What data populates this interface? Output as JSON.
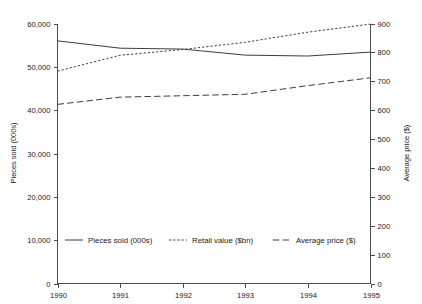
{
  "chart_data": {
    "type": "line",
    "title": "",
    "subtitle": "",
    "xlabel": "",
    "ylabel": "Pieces sold (000s)",
    "y2label": "Average price ($)",
    "x": [
      "1990",
      "1991",
      "1992",
      "1993",
      "1994",
      "1995"
    ],
    "categories": [
      "1990",
      "1991",
      "1992",
      "1993",
      "1994",
      "1995"
    ],
    "ylim": [
      0,
      60000
    ],
    "y2lim": [
      0,
      900
    ],
    "yticks": [
      "0",
      "10,000",
      "20,000",
      "30,000",
      "40,000",
      "50,000",
      "60,000"
    ],
    "ytick_values": [
      0,
      10000,
      20000,
      30000,
      40000,
      50000,
      60000
    ],
    "y2ticks": [
      "0",
      "100",
      "200",
      "300",
      "400",
      "500",
      "600",
      "700",
      "800",
      "900"
    ],
    "y2tick_values": [
      0,
      100,
      200,
      300,
      400,
      500,
      600,
      700,
      800,
      900
    ],
    "grid": false,
    "legend_position": "bottom-inside",
    "series": [
      {
        "name": "Pieces sold (000s)",
        "style": "solid",
        "axis": "left",
        "values": [
          56000,
          54300,
          54100,
          52700,
          52500,
          53400
        ]
      },
      {
        "name": "Retail value ($bn)",
        "style": "dotted",
        "axis": "right",
        "values": [
          735,
          790,
          810,
          835,
          870,
          898
        ]
      },
      {
        "name": "Average price ($)",
        "style": "dashed",
        "axis": "right",
        "values": [
          620,
          645,
          650,
          655,
          685,
          712
        ]
      }
    ]
  },
  "legend": {
    "items": [
      {
        "label": "Pieces sold (000s)",
        "style": "solid"
      },
      {
        "label": "Retail value ($bn)",
        "style": "dotted"
      },
      {
        "label": "Average price ($)",
        "style": "dashed"
      }
    ]
  },
  "axes": {
    "left_title": "Pieces sold (000s)",
    "right_title": "Average price ($)"
  }
}
